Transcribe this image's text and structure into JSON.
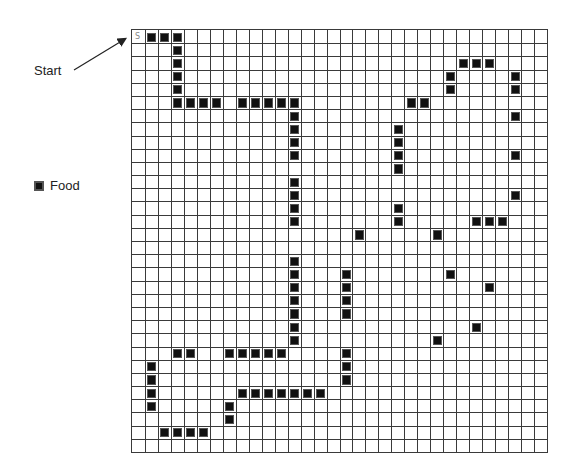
{
  "labels": {
    "start": "Start",
    "start_cell_marker": "S",
    "legend_food": "Food"
  },
  "grid": {
    "cols": 32,
    "rows": 32,
    "start": {
      "row": 0,
      "col": 0
    },
    "food_count": 89,
    "food": [
      [
        0,
        1
      ],
      [
        0,
        2
      ],
      [
        0,
        3
      ],
      [
        1,
        3
      ],
      [
        2,
        3
      ],
      [
        3,
        3
      ],
      [
        4,
        3
      ],
      [
        5,
        3
      ],
      [
        5,
        4
      ],
      [
        5,
        5
      ],
      [
        5,
        6
      ],
      [
        5,
        8
      ],
      [
        5,
        9
      ],
      [
        5,
        10
      ],
      [
        5,
        11
      ],
      [
        5,
        12
      ],
      [
        6,
        12
      ],
      [
        7,
        12
      ],
      [
        8,
        12
      ],
      [
        9,
        12
      ],
      [
        11,
        12
      ],
      [
        12,
        12
      ],
      [
        13,
        12
      ],
      [
        14,
        12
      ],
      [
        17,
        12
      ],
      [
        18,
        12
      ],
      [
        19,
        12
      ],
      [
        20,
        12
      ],
      [
        21,
        12
      ],
      [
        22,
        12
      ],
      [
        23,
        12
      ],
      [
        24,
        3
      ],
      [
        24,
        4
      ],
      [
        24,
        7
      ],
      [
        24,
        8
      ],
      [
        24,
        9
      ],
      [
        24,
        10
      ],
      [
        24,
        11
      ],
      [
        25,
        1
      ],
      [
        26,
        1
      ],
      [
        27,
        1
      ],
      [
        28,
        1
      ],
      [
        30,
        2
      ],
      [
        30,
        3
      ],
      [
        30,
        4
      ],
      [
        30,
        5
      ],
      [
        28,
        7
      ],
      [
        29,
        7
      ],
      [
        27,
        8
      ],
      [
        27,
        9
      ],
      [
        27,
        10
      ],
      [
        27,
        11
      ],
      [
        27,
        12
      ],
      [
        27,
        13
      ],
      [
        27,
        14
      ],
      [
        24,
        16
      ],
      [
        25,
        16
      ],
      [
        26,
        16
      ],
      [
        18,
        16
      ],
      [
        19,
        16
      ],
      [
        20,
        16
      ],
      [
        21,
        16
      ],
      [
        15,
        17
      ],
      [
        13,
        20
      ],
      [
        14,
        20
      ],
      [
        7,
        20
      ],
      [
        8,
        20
      ],
      [
        9,
        20
      ],
      [
        10,
        20
      ],
      [
        5,
        21
      ],
      [
        5,
        22
      ],
      [
        3,
        24
      ],
      [
        4,
        24
      ],
      [
        2,
        25
      ],
      [
        2,
        26
      ],
      [
        2,
        27
      ],
      [
        3,
        29
      ],
      [
        4,
        29
      ],
      [
        6,
        29
      ],
      [
        9,
        29
      ],
      [
        12,
        29
      ],
      [
        14,
        26
      ],
      [
        14,
        27
      ],
      [
        14,
        28
      ],
      [
        15,
        23
      ],
      [
        18,
        24
      ],
      [
        19,
        27
      ],
      [
        22,
        26
      ],
      [
        23,
        23
      ]
    ]
  },
  "colors": {
    "food": "#111111",
    "grid_line": "#3a3a3a",
    "background": "#ffffff"
  }
}
